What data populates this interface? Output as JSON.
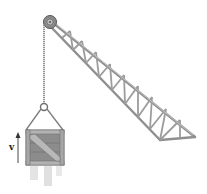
{
  "diagram": {
    "velocity_label": "v",
    "velocity_direction": "up",
    "colors": {
      "steel": "#9a9a9a",
      "steel_dark": "#6e6e6e",
      "wood": "#8c8c8c",
      "wood_light": "#b4b4b4",
      "cable": "#7a7a7a",
      "shadow": "#d6d6d6",
      "arrow": "#555555"
    }
  }
}
